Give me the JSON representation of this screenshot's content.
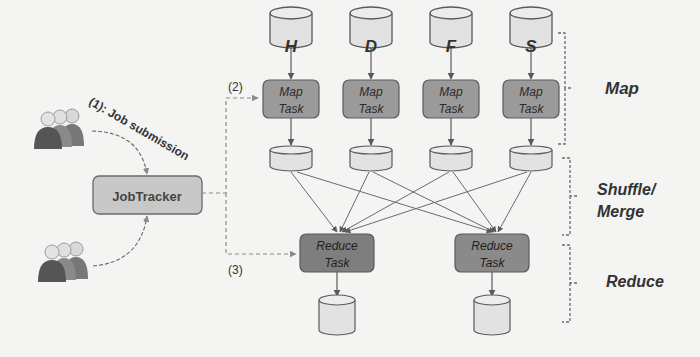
{
  "diagram": {
    "type": "mapreduce-architecture",
    "input_stores": [
      {
        "label": "H"
      },
      {
        "label": "D"
      },
      {
        "label": "F"
      },
      {
        "label": "S"
      }
    ],
    "map_tasks": [
      {
        "line1": "Map",
        "line2": "Task"
      },
      {
        "line1": "Map",
        "line2": "Task"
      },
      {
        "line1": "Map",
        "line2": "Task"
      },
      {
        "line1": "Map",
        "line2": "Task"
      }
    ],
    "reduce_tasks": [
      {
        "line1": "Reduce",
        "line2": "Task"
      },
      {
        "line1": "Reduce",
        "line2": "Task"
      }
    ],
    "jobtracker": {
      "label": "JobTracker"
    },
    "steps": {
      "submission": "(1): Job submission",
      "step2": "(2)",
      "step3": "(3)"
    },
    "phases": {
      "map": "Map",
      "shuffle_line1": "Shuffle/",
      "shuffle_line2": "Merge",
      "reduce": "Reduce"
    },
    "colors": {
      "store_fill": "#e2e2e2",
      "task_fill": "#9a9a9a",
      "reduce_fill": "#7e7e7e",
      "jobtracker_fill": "#c8c8c8",
      "stroke": "#5a5a5a",
      "dash": "#7a7a7a"
    }
  }
}
